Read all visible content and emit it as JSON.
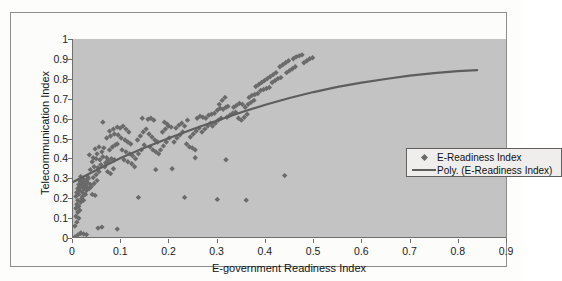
{
  "chart_data": {
    "type": "scatter",
    "title": "",
    "xlabel": "E-government Readiness Index",
    "ylabel": "Telecommunication Index",
    "xlim": [
      0,
      0.9
    ],
    "ylim": [
      0,
      1
    ],
    "xticks": [
      "0",
      "0.1",
      "0.2",
      "0.3",
      "0.4",
      "0.5",
      "0.6",
      "0.7",
      "0.8",
      "0.9"
    ],
    "yticks": [
      "0",
      "0.1",
      "0.2",
      "0.3",
      "0.4",
      "0.5",
      "0.6",
      "0.7",
      "0.8",
      "0.9",
      "1"
    ],
    "grid": false,
    "legend_position": "center-right-inside",
    "legend": [
      {
        "label": "E-Readiness Index",
        "marker": "diamond",
        "color": "#6a6a6a"
      },
      {
        "label": "Poly. (E-Readiness Index)",
        "marker": "line",
        "color": "#5e5e5e"
      }
    ],
    "series": [
      {
        "name": "E-Readiness Index",
        "marker": "diamond",
        "color": "#6a6a6a",
        "points": [
          [
            0.004,
            0.0
          ],
          [
            0.01,
            0.01
          ],
          [
            0.016,
            0.02
          ],
          [
            0.022,
            0.015
          ],
          [
            0.004,
            0.055
          ],
          [
            0.008,
            0.075
          ],
          [
            0.012,
            0.095
          ],
          [
            0.006,
            0.105
          ],
          [
            0.01,
            0.125
          ],
          [
            0.014,
            0.135
          ],
          [
            0.006,
            0.145
          ],
          [
            0.012,
            0.155
          ],
          [
            0.008,
            0.165
          ],
          [
            0.016,
            0.175
          ],
          [
            0.01,
            0.185
          ],
          [
            0.018,
            0.195
          ],
          [
            0.022,
            0.185
          ],
          [
            0.006,
            0.205
          ],
          [
            0.012,
            0.215
          ],
          [
            0.02,
            0.205
          ],
          [
            0.008,
            0.225
          ],
          [
            0.014,
            0.235
          ],
          [
            0.02,
            0.225
          ],
          [
            0.026,
            0.215
          ],
          [
            0.01,
            0.245
          ],
          [
            0.016,
            0.255
          ],
          [
            0.022,
            0.245
          ],
          [
            0.028,
            0.255
          ],
          [
            0.012,
            0.265
          ],
          [
            0.018,
            0.275
          ],
          [
            0.024,
            0.265
          ],
          [
            0.03,
            0.275
          ],
          [
            0.014,
            0.285
          ],
          [
            0.02,
            0.295
          ],
          [
            0.026,
            0.285
          ],
          [
            0.032,
            0.295
          ],
          [
            0.016,
            0.305
          ],
          [
            0.022,
            0.265
          ],
          [
            0.028,
            0.235
          ],
          [
            0.034,
            0.245
          ],
          [
            0.018,
            0.255
          ],
          [
            0.024,
            0.285
          ],
          [
            0.03,
            0.305
          ],
          [
            0.036,
            0.265
          ],
          [
            0.04,
            0.215
          ],
          [
            0.046,
            0.21
          ],
          [
            0.038,
            0.255
          ],
          [
            0.044,
            0.27
          ],
          [
            0.05,
            0.285
          ],
          [
            0.042,
            0.3
          ],
          [
            0.048,
            0.315
          ],
          [
            0.054,
            0.33
          ],
          [
            0.036,
            0.34
          ],
          [
            0.044,
            0.355
          ],
          [
            0.052,
            0.35
          ],
          [
            0.058,
            0.365
          ],
          [
            0.04,
            0.38
          ],
          [
            0.048,
            0.395
          ],
          [
            0.056,
            0.39
          ],
          [
            0.062,
            0.405
          ],
          [
            0.034,
            0.415
          ],
          [
            0.042,
            0.4
          ],
          [
            0.05,
            0.42
          ],
          [
            0.06,
            0.43
          ],
          [
            0.046,
            0.445
          ],
          [
            0.054,
            0.455
          ],
          [
            0.064,
            0.45
          ],
          [
            0.07,
            0.4
          ],
          [
            0.066,
            0.355
          ],
          [
            0.072,
            0.33
          ],
          [
            0.078,
            0.32
          ],
          [
            0.084,
            0.345
          ],
          [
            0.068,
            0.375
          ],
          [
            0.074,
            0.385
          ],
          [
            0.08,
            0.395
          ],
          [
            0.086,
            0.39
          ],
          [
            0.076,
            0.44
          ],
          [
            0.082,
            0.455
          ],
          [
            0.088,
            0.465
          ],
          [
            0.092,
            0.47
          ],
          [
            0.07,
            0.5
          ],
          [
            0.078,
            0.51
          ],
          [
            0.086,
            0.52
          ],
          [
            0.094,
            0.515
          ],
          [
            0.076,
            0.535
          ],
          [
            0.084,
            0.545
          ],
          [
            0.092,
            0.555
          ],
          [
            0.098,
            0.55
          ],
          [
            0.062,
            0.58
          ],
          [
            0.104,
            0.56
          ],
          [
            0.11,
            0.545
          ],
          [
            0.116,
            0.53
          ],
          [
            0.1,
            0.5
          ],
          [
            0.108,
            0.49
          ],
          [
            0.114,
            0.48
          ],
          [
            0.12,
            0.47
          ],
          [
            0.102,
            0.44
          ],
          [
            0.11,
            0.43
          ],
          [
            0.118,
            0.42
          ],
          [
            0.124,
            0.41
          ],
          [
            0.106,
            0.39
          ],
          [
            0.114,
            0.38
          ],
          [
            0.122,
            0.37
          ],
          [
            0.128,
            0.355
          ],
          [
            0.13,
            0.395
          ],
          [
            0.136,
            0.42
          ],
          [
            0.142,
            0.44
          ],
          [
            0.148,
            0.465
          ],
          [
            0.134,
            0.49
          ],
          [
            0.14,
            0.51
          ],
          [
            0.146,
            0.53
          ],
          [
            0.152,
            0.545
          ],
          [
            0.144,
            0.6
          ],
          [
            0.156,
            0.595
          ],
          [
            0.162,
            0.6
          ],
          [
            0.168,
            0.59
          ],
          [
            0.158,
            0.52
          ],
          [
            0.164,
            0.505
          ],
          [
            0.17,
            0.49
          ],
          [
            0.176,
            0.48
          ],
          [
            0.16,
            0.455
          ],
          [
            0.166,
            0.44
          ],
          [
            0.172,
            0.43
          ],
          [
            0.178,
            0.42
          ],
          [
            0.182,
            0.44
          ],
          [
            0.188,
            0.46
          ],
          [
            0.194,
            0.48
          ],
          [
            0.2,
            0.5
          ],
          [
            0.186,
            0.53
          ],
          [
            0.192,
            0.545
          ],
          [
            0.198,
            0.56
          ],
          [
            0.204,
            0.555
          ],
          [
            0.19,
            0.58
          ],
          [
            0.196,
            0.57
          ],
          [
            0.206,
            0.345
          ],
          [
            0.172,
            0.34
          ],
          [
            0.21,
            0.48
          ],
          [
            0.216,
            0.5
          ],
          [
            0.222,
            0.515
          ],
          [
            0.228,
            0.53
          ],
          [
            0.214,
            0.55
          ],
          [
            0.22,
            0.565
          ],
          [
            0.226,
            0.575
          ],
          [
            0.232,
            0.56
          ],
          [
            0.236,
            0.47
          ],
          [
            0.242,
            0.455
          ],
          [
            0.248,
            0.45
          ],
          [
            0.254,
            0.44
          ],
          [
            0.244,
            0.505
          ],
          [
            0.25,
            0.52
          ],
          [
            0.256,
            0.535
          ],
          [
            0.262,
            0.55
          ],
          [
            0.238,
            0.59
          ],
          [
            0.258,
            0.6
          ],
          [
            0.264,
            0.61
          ],
          [
            0.27,
            0.605
          ],
          [
            0.268,
            0.53
          ],
          [
            0.274,
            0.545
          ],
          [
            0.28,
            0.56
          ],
          [
            0.286,
            0.575
          ],
          [
            0.276,
            0.6
          ],
          [
            0.282,
            0.615
          ],
          [
            0.288,
            0.62
          ],
          [
            0.294,
            0.625
          ],
          [
            0.29,
            0.56
          ],
          [
            0.296,
            0.575
          ],
          [
            0.302,
            0.59
          ],
          [
            0.308,
            0.6
          ],
          [
            0.3,
            0.64
          ],
          [
            0.306,
            0.65
          ],
          [
            0.312,
            0.645
          ],
          [
            0.318,
            0.655
          ],
          [
            0.304,
            0.67
          ],
          [
            0.31,
            0.69
          ],
          [
            0.316,
            0.705
          ],
          [
            0.322,
            0.66
          ],
          [
            0.32,
            0.605
          ],
          [
            0.326,
            0.615
          ],
          [
            0.332,
            0.625
          ],
          [
            0.338,
            0.63
          ],
          [
            0.334,
            0.655
          ],
          [
            0.34,
            0.665
          ],
          [
            0.346,
            0.675
          ],
          [
            0.352,
            0.67
          ],
          [
            0.344,
            0.6
          ],
          [
            0.35,
            0.59
          ],
          [
            0.356,
            0.605
          ],
          [
            0.362,
            0.62
          ],
          [
            0.358,
            0.655
          ],
          [
            0.364,
            0.67
          ],
          [
            0.37,
            0.68
          ],
          [
            0.376,
            0.69
          ],
          [
            0.366,
            0.705
          ],
          [
            0.372,
            0.715
          ],
          [
            0.378,
            0.72
          ],
          [
            0.384,
            0.725
          ],
          [
            0.38,
            0.76
          ],
          [
            0.386,
            0.77
          ],
          [
            0.392,
            0.78
          ],
          [
            0.398,
            0.79
          ],
          [
            0.39,
            0.74
          ],
          [
            0.396,
            0.745
          ],
          [
            0.402,
            0.75
          ],
          [
            0.408,
            0.755
          ],
          [
            0.404,
            0.8
          ],
          [
            0.41,
            0.81
          ],
          [
            0.416,
            0.82
          ],
          [
            0.422,
            0.83
          ],
          [
            0.414,
            0.78
          ],
          [
            0.42,
            0.79
          ],
          [
            0.426,
            0.8
          ],
          [
            0.432,
            0.805
          ],
          [
            0.43,
            0.86
          ],
          [
            0.436,
            0.87
          ],
          [
            0.442,
            0.88
          ],
          [
            0.448,
            0.89
          ],
          [
            0.444,
            0.83
          ],
          [
            0.45,
            0.84
          ],
          [
            0.456,
            0.85
          ],
          [
            0.462,
            0.86
          ],
          [
            0.458,
            0.9
          ],
          [
            0.464,
            0.91
          ],
          [
            0.47,
            0.915
          ],
          [
            0.476,
            0.92
          ],
          [
            0.48,
            0.88
          ],
          [
            0.486,
            0.89
          ],
          [
            0.492,
            0.9
          ],
          [
            0.498,
            0.905
          ],
          [
            0.136,
            0.2
          ],
          [
            0.232,
            0.2
          ],
          [
            0.3,
            0.19
          ],
          [
            0.36,
            0.186
          ],
          [
            0.44,
            0.31
          ],
          [
            0.254,
            0.4
          ],
          [
            0.318,
            0.39
          ],
          [
            0.092,
            0.04
          ],
          [
            0.052,
            0.045
          ],
          [
            0.06,
            0.05
          ],
          [
            0.016,
            0.018
          ],
          [
            0.028,
            0.012
          ]
        ]
      }
    ],
    "trendline": {
      "name": "Poly. (E-Readiness Index)",
      "type": "polynomial",
      "color": "#5e5e5e",
      "points": [
        [
          0.0,
          0.278
        ],
        [
          0.05,
          0.34
        ],
        [
          0.1,
          0.4
        ],
        [
          0.15,
          0.452
        ],
        [
          0.2,
          0.5
        ],
        [
          0.25,
          0.545
        ],
        [
          0.3,
          0.588
        ],
        [
          0.35,
          0.63
        ],
        [
          0.4,
          0.668
        ],
        [
          0.45,
          0.702
        ],
        [
          0.5,
          0.732
        ],
        [
          0.55,
          0.758
        ],
        [
          0.6,
          0.78
        ],
        [
          0.65,
          0.798
        ],
        [
          0.7,
          0.815
        ],
        [
          0.75,
          0.828
        ],
        [
          0.8,
          0.838
        ],
        [
          0.84,
          0.843
        ]
      ]
    }
  }
}
